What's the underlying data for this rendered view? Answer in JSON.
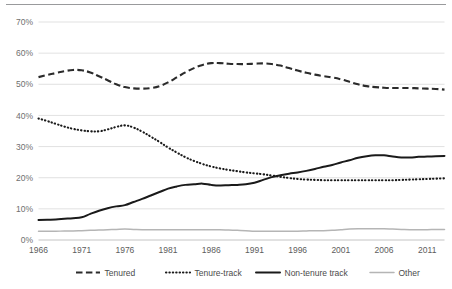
{
  "chart_data": {
    "type": "line",
    "title": "",
    "subtitle": "",
    "xlabel": "",
    "ylabel": "",
    "grid": "horizontal",
    "legend_position": "bottom",
    "xlim": [
      1966,
      2013
    ],
    "ylim": [
      0,
      70
    ],
    "x_tick_labels": [
      "1966",
      "1971",
      "1976",
      "1981",
      "1986",
      "1991",
      "1996",
      "2001",
      "2006",
      "2011"
    ],
    "x_tick_values": [
      1966,
      1971,
      1976,
      1981,
      1986,
      1991,
      1996,
      2001,
      2006,
      2011
    ],
    "y_tick_labels": [
      "0%",
      "10%",
      "20%",
      "30%",
      "40%",
      "50%",
      "60%",
      "70%"
    ],
    "y_tick_values": [
      0,
      10,
      20,
      30,
      40,
      50,
      60,
      70
    ],
    "x": [
      1966,
      1967,
      1968,
      1969,
      1970,
      1971,
      1972,
      1973,
      1974,
      1975,
      1976,
      1977,
      1978,
      1979,
      1980,
      1981,
      1982,
      1983,
      1984,
      1985,
      1986,
      1987,
      1988,
      1989,
      1990,
      1991,
      1992,
      1993,
      1994,
      1995,
      1996,
      1997,
      1998,
      1999,
      2000,
      2001,
      2002,
      2003,
      2004,
      2005,
      2006,
      2007,
      2008,
      2009,
      2010,
      2011,
      2012,
      2013
    ],
    "series": [
      {
        "name": "Tenured",
        "style": "dashed",
        "color": "#2b2b2b",
        "values": [
          52.3,
          53.0,
          53.6,
          54.2,
          54.6,
          54.5,
          53.8,
          52.6,
          51.3,
          50.0,
          49.1,
          48.7,
          48.6,
          48.8,
          49.4,
          50.6,
          52.2,
          53.8,
          55.2,
          56.2,
          56.8,
          56.8,
          56.6,
          56.5,
          56.5,
          56.6,
          56.7,
          56.5,
          56.0,
          55.2,
          54.4,
          53.7,
          53.1,
          52.6,
          52.2,
          51.6,
          50.8,
          50.0,
          49.4,
          49.1,
          48.9,
          48.8,
          48.8,
          48.8,
          48.7,
          48.6,
          48.5,
          48.3
        ]
      },
      {
        "name": "Tenure-track",
        "style": "dotted",
        "color": "#1a1a1a",
        "values": [
          39.0,
          38.2,
          37.3,
          36.4,
          35.7,
          35.2,
          34.9,
          34.9,
          35.5,
          36.3,
          36.8,
          36.1,
          34.8,
          33.2,
          31.5,
          29.7,
          28.1,
          26.6,
          25.4,
          24.4,
          23.6,
          23.0,
          22.5,
          22.1,
          21.7,
          21.4,
          21.1,
          20.7,
          20.3,
          19.9,
          19.6,
          19.4,
          19.3,
          19.2,
          19.2,
          19.2,
          19.2,
          19.2,
          19.2,
          19.2,
          19.2,
          19.2,
          19.3,
          19.4,
          19.5,
          19.6,
          19.7,
          19.8
        ]
      },
      {
        "name": "Non-tenure track",
        "style": "solid",
        "color": "#1a1a1a",
        "values": [
          6.4,
          6.5,
          6.6,
          6.8,
          7.0,
          7.3,
          8.4,
          9.4,
          10.2,
          10.8,
          11.2,
          12.2,
          13.2,
          14.3,
          15.4,
          16.5,
          17.2,
          17.7,
          17.9,
          18.1,
          17.7,
          17.5,
          17.6,
          17.7,
          17.9,
          18.4,
          19.3,
          20.2,
          20.8,
          21.3,
          21.7,
          22.2,
          22.8,
          23.5,
          24.1,
          24.9,
          25.6,
          26.4,
          26.9,
          27.2,
          27.2,
          26.8,
          26.5,
          26.5,
          26.7,
          26.8,
          26.9,
          27.0
        ]
      },
      {
        "name": "Other",
        "style": "solid-light",
        "color": "#b5b5b5",
        "values": [
          2.8,
          2.8,
          2.8,
          2.9,
          2.9,
          3.0,
          3.1,
          3.2,
          3.3,
          3.4,
          3.5,
          3.4,
          3.3,
          3.3,
          3.3,
          3.3,
          3.3,
          3.3,
          3.3,
          3.3,
          3.3,
          3.3,
          3.2,
          3.1,
          3.0,
          2.8,
          2.8,
          2.8,
          2.8,
          2.8,
          2.8,
          2.9,
          3.0,
          3.0,
          3.1,
          3.3,
          3.5,
          3.6,
          3.6,
          3.6,
          3.6,
          3.5,
          3.4,
          3.3,
          3.3,
          3.3,
          3.4,
          3.4
        ]
      }
    ]
  },
  "legend": {
    "items": [
      {
        "label": "Tenured",
        "style": "dashed",
        "color": "#2b2b2b"
      },
      {
        "label": "Tenure-track",
        "style": "dotted",
        "color": "#1a1a1a"
      },
      {
        "label": "Non-tenure track",
        "style": "solid",
        "color": "#1a1a1a"
      },
      {
        "label": "Other",
        "style": "solid-light",
        "color": "#b5b5b5"
      }
    ]
  },
  "colors": {
    "gridline": "#d9d9d9",
    "axis": "#bdbdbd",
    "top_rule": "#999a9c",
    "tick_text": "#6f6f6f",
    "background": "#ffffff"
  }
}
